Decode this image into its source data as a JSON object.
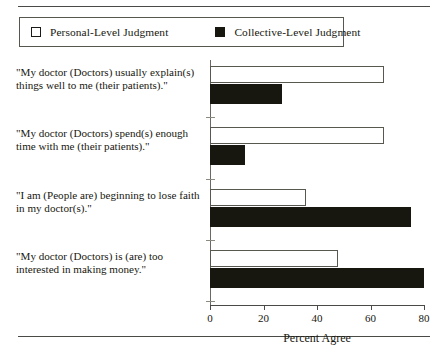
{
  "figure": {
    "legend": {
      "entries": [
        {
          "label": "Personal-Level Judgment",
          "swatch": "open-square-icon",
          "color": "#ffffff"
        },
        {
          "label": "Collective-Level Judgment",
          "swatch": "filled-square-icon",
          "color": "#17170f"
        }
      ]
    }
  },
  "chart_data": {
    "type": "bar",
    "orientation": "horizontal",
    "title": "",
    "xlabel": "Percent Agree",
    "ylabel": "",
    "xlim": [
      0,
      80
    ],
    "xticks": [
      0,
      20,
      40,
      60,
      80
    ],
    "xticklabels": [
      "0",
      "20",
      "40",
      "60",
      "80"
    ],
    "grid": false,
    "legend_position": "top-left",
    "categories": [
      "\"My doctor (Doctors) usually explain(s) things well to me (their patients).\"",
      "\"My doctor (Doctors) spend(s) enough time with me (their patients).\"",
      "\"I am (People are) beginning to lose faith in my doctor(s).\"",
      "\"My doctor (Doctors) is (are) too interested in making money.\""
    ],
    "series": [
      {
        "name": "Personal-Level Judgment",
        "values": [
          65,
          65,
          36,
          48
        ],
        "color": "#ffffff"
      },
      {
        "name": "Collective-Level Judgment",
        "values": [
          27,
          13,
          75,
          80
        ],
        "color": "#17170f"
      }
    ]
  }
}
